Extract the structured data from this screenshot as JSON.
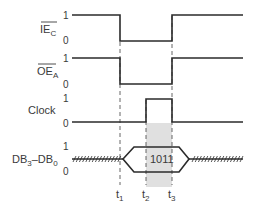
{
  "diagram": {
    "type": "timing-diagram",
    "signals": [
      {
        "id": "iec",
        "name": "IE",
        "subscript": "C",
        "overbar": true,
        "levels": [
          "1",
          "0"
        ],
        "waveform": "high until t1, low from t1 to t3, high after t3"
      },
      {
        "id": "oea",
        "name": "OE",
        "subscript": "A",
        "overbar": true,
        "levels": [
          "1",
          "0"
        ],
        "waveform": "high until t1, low from t1 to t3, high after t3"
      },
      {
        "id": "clock",
        "name": "Clock",
        "levels": [
          "1",
          "0"
        ],
        "waveform": "low until t2, high from t2 to t3, low after t3"
      },
      {
        "id": "db",
        "name_parts": [
          "DB",
          "3",
          "–DB",
          "0"
        ],
        "levels": [
          "1",
          "0"
        ],
        "waveform": "indeterminate until t1, valid data from t1 to after t3, indeterminate after",
        "data_value": "1011"
      }
    ],
    "time_markers": [
      {
        "name": "t",
        "subscript": "1"
      },
      {
        "name": "t",
        "subscript": "2"
      },
      {
        "name": "t",
        "subscript": "3"
      }
    ],
    "highlight": {
      "from": "t2",
      "to": "t3",
      "color": "#e0e0e0"
    }
  }
}
